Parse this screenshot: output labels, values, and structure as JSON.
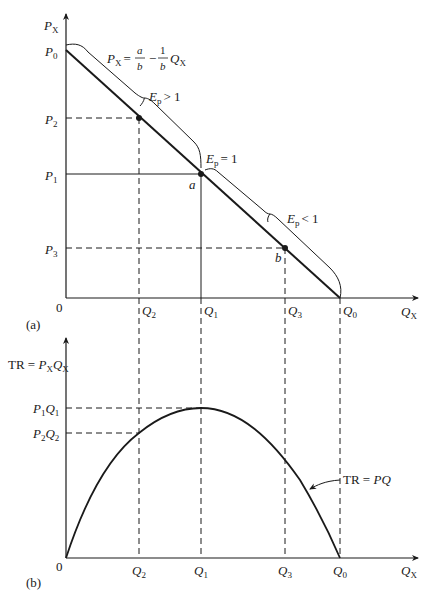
{
  "panels": {
    "a": {
      "label": "(a)",
      "y_axis": {
        "symbol": "P",
        "subscript": "X"
      },
      "x_axis": {
        "symbol": "Q",
        "subscript": "X"
      },
      "origin": "0",
      "price_ticks": [
        {
          "symbol": "P",
          "sub": "0"
        },
        {
          "symbol": "P",
          "sub": "2"
        },
        {
          "symbol": "P",
          "sub": "1"
        },
        {
          "symbol": "P",
          "sub": "3"
        }
      ],
      "quantity_ticks": [
        {
          "symbol": "Q",
          "sub": "2"
        },
        {
          "symbol": "Q",
          "sub": "1"
        },
        {
          "symbol": "Q",
          "sub": "3"
        },
        {
          "symbol": "Q",
          "sub": "0"
        }
      ],
      "demand_equation": {
        "lhs": "P",
        "lhs_sub": "X",
        "eq": "=",
        "frac1_num": "a",
        "frac1_den": "b",
        "minus": "−",
        "frac2_num": "1",
        "frac2_den": "b",
        "var": "Q",
        "var_sub": "X"
      },
      "elasticity_labels": [
        {
          "text": "E",
          "sub": "p",
          "rel": "> 1"
        },
        {
          "text": "E",
          "sub": "p",
          "rel": "= 1"
        },
        {
          "text": "E",
          "sub": "p",
          "rel": "< 1"
        }
      ],
      "points": [
        {
          "name": "a"
        },
        {
          "name": "b"
        }
      ]
    },
    "b": {
      "label": "(b)",
      "y_axis": {
        "text": "TR = ",
        "p": "P",
        "p_sub": "X",
        "q": "Q",
        "q_sub": "X"
      },
      "x_axis": {
        "symbol": "Q",
        "subscript": "X"
      },
      "origin": "0",
      "revenue_ticks": [
        {
          "p": "P",
          "p_sub": "1",
          "q": "Q",
          "q_sub": "1"
        },
        {
          "p": "P",
          "p_sub": "2",
          "q": "Q",
          "q_sub": "2"
        }
      ],
      "quantity_ticks": [
        {
          "symbol": "Q",
          "sub": "2"
        },
        {
          "symbol": "Q",
          "sub": "1"
        },
        {
          "symbol": "Q",
          "sub": "3"
        },
        {
          "symbol": "Q",
          "sub": "0"
        }
      ],
      "curve_label": {
        "text": "TR = ",
        "pq": "PQ"
      }
    }
  },
  "colors": {
    "line": "#1a1a1a",
    "background": "#ffffff"
  }
}
